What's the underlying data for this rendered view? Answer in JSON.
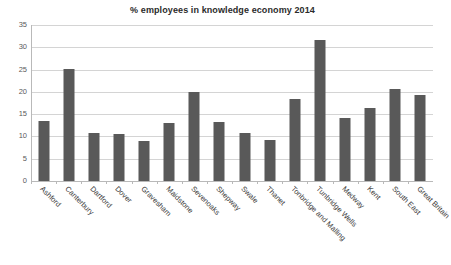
{
  "chart_data": {
    "type": "bar",
    "title": "% employees in knowledge economy 2014",
    "xlabel": "",
    "ylabel": "",
    "ylim": [
      0,
      35
    ],
    "yticks": [
      0,
      5,
      10,
      15,
      20,
      25,
      30,
      35
    ],
    "ytick_labels": [
      "0",
      "5",
      "10",
      "15",
      "20",
      "25",
      "30",
      "35"
    ],
    "grid": true,
    "legend": false,
    "bar_color": "#595959",
    "categories": [
      "Ashford",
      "Canterbury",
      "Dartford",
      "Dover",
      "Gravesham",
      "Maidstone",
      "Sevenoaks",
      "Shepway",
      "Swale",
      "Thanet",
      "Tonbridge and Malling",
      "Tunbridge Wells",
      "Medway",
      "Kent",
      "South East",
      "Great Britain"
    ],
    "values": [
      13.5,
      25.2,
      10.7,
      10.6,
      8.9,
      13.0,
      20.0,
      13.2,
      10.7,
      9.3,
      18.5,
      31.7,
      14.2,
      16.3,
      20.7,
      19.3
    ]
  }
}
